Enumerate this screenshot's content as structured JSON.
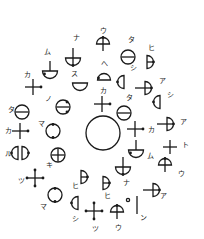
{
  "diagram": {
    "title": "",
    "center_circle": {
      "cx": 103,
      "cy": 133,
      "r": 17
    },
    "glyphs": [
      {
        "type": "dome-cross",
        "x": 103,
        "y": 44,
        "label": "ウ",
        "lx": 100,
        "ly": 33
      },
      {
        "type": "circle-bar",
        "x": 128,
        "y": 57,
        "label": "タ",
        "lx": 128,
        "ly": 42
      },
      {
        "type": "d-right-dot",
        "x": 150,
        "y": 62,
        "label": "ヒ",
        "lx": 148,
        "ly": 50
      },
      {
        "type": "bowl-cross",
        "x": 73,
        "y": 58,
        "label": "ナ",
        "lx": 73,
        "ly": 40
      },
      {
        "type": "bowl-cross-dot",
        "x": 50,
        "y": 71,
        "label": "ム",
        "lx": 44,
        "ly": 54
      },
      {
        "type": "cross-dot",
        "x": 33,
        "y": 87,
        "label": "カ",
        "lx": 24,
        "ly": 77
      },
      {
        "type": "bowl",
        "x": 80,
        "y": 86,
        "label": "ス",
        "lx": 71,
        "ly": 76
      },
      {
        "type": "dome-dot",
        "x": 104,
        "y": 77,
        "label": "へ",
        "lx": 101,
        "ly": 66
      },
      {
        "type": "d-left-dot",
        "x": 121,
        "y": 82,
        "label": "シ",
        "lx": 130,
        "ly": 70
      },
      {
        "type": "d-cross-right",
        "x": 147,
        "y": 88,
        "label": "ア",
        "lx": 159,
        "ly": 83
      },
      {
        "type": "d-left-dot",
        "x": 157,
        "y": 102,
        "label": "シ",
        "lx": 167,
        "ly": 97
      },
      {
        "type": "circle-bar-dots",
        "x": 63,
        "y": 107,
        "label": "ノ",
        "lx": 45,
        "ly": 101
      },
      {
        "type": "circle-bar",
        "x": 22,
        "y": 112,
        "label": "タ",
        "lx": 8,
        "ly": 112
      },
      {
        "type": "cross-dot",
        "x": 102,
        "y": 104,
        "label": "カ",
        "lx": 100,
        "ly": 93
      },
      {
        "type": "circle-bar",
        "x": 124,
        "y": 113,
        "label": "タ",
        "lx": 126,
        "ly": 100
      },
      {
        "type": "cross-dot",
        "x": 20,
        "y": 131,
        "label": "カ",
        "lx": 5,
        "ly": 133
      },
      {
        "type": "circle-dots",
        "x": 53,
        "y": 131,
        "label": "マ",
        "lx": 38,
        "ly": 126
      },
      {
        "type": "cross-dot",
        "x": 135,
        "y": 129,
        "label": "カ",
        "lx": 148,
        "ly": 132
      },
      {
        "type": "d-cross-right",
        "x": 169,
        "y": 124,
        "label": "ア",
        "lx": 180,
        "ly": 124
      },
      {
        "type": "cross",
        "x": 170,
        "y": 147,
        "label": "ト",
        "lx": 182,
        "ly": 147
      },
      {
        "type": "double-d",
        "x": 20,
        "y": 153,
        "label": "ル",
        "lx": 5,
        "ly": 156
      },
      {
        "type": "circle-cross",
        "x": 58,
        "y": 155,
        "label": "キ",
        "lx": 46,
        "ly": 167
      },
      {
        "type": "bowl-cross-dot",
        "x": 136,
        "y": 150,
        "label": "ム",
        "lx": 147,
        "ly": 158
      },
      {
        "type": "dome-cross",
        "x": 165,
        "y": 165,
        "label": "ウ",
        "lx": 178,
        "ly": 176
      },
      {
        "type": "cross-dots",
        "x": 35,
        "y": 178,
        "label": "ツ",
        "lx": 18,
        "ly": 183
      },
      {
        "type": "d-right-dot",
        "x": 84,
        "y": 177,
        "label": "ヒ",
        "lx": 72,
        "ly": 188
      },
      {
        "type": "bowl-cross",
        "x": 123,
        "y": 167,
        "label": "ナ",
        "lx": 123,
        "ly": 185
      },
      {
        "type": "d-right-dot",
        "x": 106,
        "y": 183,
        "label": "ヒ",
        "lx": 104,
        "ly": 198
      },
      {
        "type": "d-cross-right",
        "x": 155,
        "y": 190,
        "label": "ア",
        "lx": 160,
        "ly": 198
      },
      {
        "type": "circle-dots",
        "x": 55,
        "y": 195,
        "label": "マ",
        "lx": 40,
        "ly": 209
      },
      {
        "type": "d-left-dot",
        "x": 75,
        "y": 203,
        "label": "シ",
        "lx": 72,
        "ly": 221
      },
      {
        "type": "cross-dots",
        "x": 94,
        "y": 211,
        "label": "ツ",
        "lx": 92,
        "ly": 231
      },
      {
        "type": "dome-cross",
        "x": 117,
        "y": 212,
        "label": "ウ",
        "lx": 115,
        "ly": 230
      },
      {
        "type": "small-circle",
        "x": 128,
        "y": 200,
        "label": "",
        "lx": 0,
        "ly": 0
      },
      {
        "type": "vline",
        "x": 137,
        "y": 205,
        "label": "ン",
        "lx": 140,
        "ly": 220
      }
    ]
  }
}
